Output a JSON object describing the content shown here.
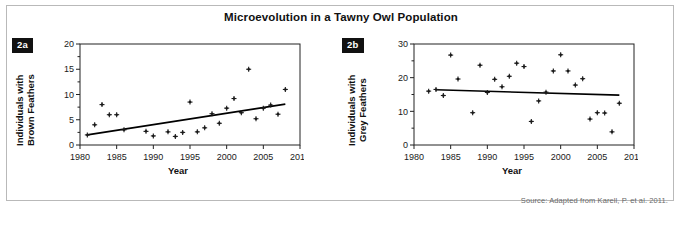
{
  "figure": {
    "title": "Microevolution in a Tawny Owl Population",
    "source_note": "Source: Adapted from Karell, P. et al. 2011.",
    "frame_color": "#b9b9b9",
    "marker_color": "#1a1a1a",
    "trendline_color": "#000000"
  },
  "panels": {
    "a": {
      "badge": "2a",
      "ylabel": "Individuals with\nBrown Feathers",
      "ylabel_line1": "Individuals with",
      "ylabel_line2": "Brown Feathers",
      "xlabel": "Year"
    },
    "b": {
      "badge": "2b",
      "ylabel": "Individuals with\nGrey Feathers",
      "ylabel_line1": "Individuals with",
      "ylabel_line2": "Grey Feathers",
      "xlabel": "Year"
    }
  },
  "chart_data": [
    {
      "type": "scatter",
      "panel": "2a",
      "title": "Microevolution in a Tawny Owl Population",
      "subtitle": "Individuals with Brown Feathers",
      "xlabel": "Year",
      "ylabel": "Individuals with Brown Feathers",
      "xlim": [
        1980,
        2010
      ],
      "ylim": [
        0,
        20
      ],
      "xticks": [
        1980,
        1985,
        1990,
        1995,
        2000,
        2005,
        2010
      ],
      "yticks": [
        0,
        5,
        10,
        15,
        20
      ],
      "yminorticks": [
        2.5,
        7.5,
        12.5,
        17.5
      ],
      "grid": false,
      "legend": false,
      "points": [
        {
          "x": 1981,
          "y": 2.0
        },
        {
          "x": 1982,
          "y": 4.0
        },
        {
          "x": 1983,
          "y": 8.0
        },
        {
          "x": 1984,
          "y": 6.0
        },
        {
          "x": 1985,
          "y": 6.0
        },
        {
          "x": 1986,
          "y": 3.0
        },
        {
          "x": 1989,
          "y": 2.7
        },
        {
          "x": 1990,
          "y": 1.8
        },
        {
          "x": 1992,
          "y": 2.6
        },
        {
          "x": 1993,
          "y": 1.7
        },
        {
          "x": 1994,
          "y": 2.5
        },
        {
          "x": 1995,
          "y": 8.5
        },
        {
          "x": 1996,
          "y": 2.6
        },
        {
          "x": 1997,
          "y": 3.4
        },
        {
          "x": 1998,
          "y": 6.2
        },
        {
          "x": 1999,
          "y": 4.3
        },
        {
          "x": 2000,
          "y": 7.3
        },
        {
          "x": 2001,
          "y": 9.2
        },
        {
          "x": 2002,
          "y": 6.4
        },
        {
          "x": 2003,
          "y": 15.0
        },
        {
          "x": 2004,
          "y": 5.2
        },
        {
          "x": 2005,
          "y": 7.3
        },
        {
          "x": 2006,
          "y": 7.9
        },
        {
          "x": 2007,
          "y": 6.1
        },
        {
          "x": 2008,
          "y": 11.0
        }
      ],
      "trendline": {
        "x": [
          1981,
          2008
        ],
        "y": [
          2.0,
          8.1
        ],
        "direction": "increasing"
      }
    },
    {
      "type": "scatter",
      "panel": "2b",
      "title": "Microevolution in a Tawny Owl Population",
      "subtitle": "Individuals with Grey Feathers",
      "xlabel": "Year",
      "ylabel": "Individuals with Grey Feathers",
      "xlim": [
        1980,
        2010
      ],
      "ylim": [
        0,
        30
      ],
      "xticks": [
        1980,
        1985,
        1990,
        1995,
        2000,
        2005,
        2010
      ],
      "yticks": [
        0,
        10,
        20,
        30
      ],
      "yminorticks": [
        5,
        15,
        25
      ],
      "grid": false,
      "legend": false,
      "points": [
        {
          "x": 1982,
          "y": 16.0
        },
        {
          "x": 1983,
          "y": 16.5
        },
        {
          "x": 1984,
          "y": 14.7
        },
        {
          "x": 1985,
          "y": 26.7
        },
        {
          "x": 1986,
          "y": 19.6
        },
        {
          "x": 1988,
          "y": 9.6
        },
        {
          "x": 1989,
          "y": 23.7
        },
        {
          "x": 1990,
          "y": 15.6
        },
        {
          "x": 1991,
          "y": 19.5
        },
        {
          "x": 1992,
          "y": 17.3
        },
        {
          "x": 1993,
          "y": 20.4
        },
        {
          "x": 1994,
          "y": 24.3
        },
        {
          "x": 1995,
          "y": 23.3
        },
        {
          "x": 1996,
          "y": 7.0
        },
        {
          "x": 1997,
          "y": 13.1
        },
        {
          "x": 1998,
          "y": 15.7
        },
        {
          "x": 1999,
          "y": 22.0
        },
        {
          "x": 2000,
          "y": 26.8
        },
        {
          "x": 2001,
          "y": 22.0
        },
        {
          "x": 2002,
          "y": 17.8
        },
        {
          "x": 2003,
          "y": 19.7
        },
        {
          "x": 2004,
          "y": 7.7
        },
        {
          "x": 2005,
          "y": 9.6
        },
        {
          "x": 2006,
          "y": 9.5
        },
        {
          "x": 2007,
          "y": 3.9
        },
        {
          "x": 2008,
          "y": 12.4
        }
      ],
      "trendline": {
        "x": [
          1983,
          2008
        ],
        "y": [
          16.4,
          14.8
        ],
        "direction": "flat-slightly-decreasing"
      }
    }
  ]
}
